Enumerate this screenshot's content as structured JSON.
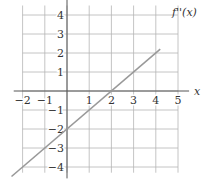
{
  "chart_data": {
    "type": "line",
    "title": "",
    "xlabel": "x",
    "ylabel": "",
    "series": [
      {
        "name": "f''(x)",
        "x": [
          -2.5,
          4.2
        ],
        "y": [
          -4.5,
          2.2
        ],
        "equation": "f''(x) = x - 2"
      }
    ],
    "xlim": [
      -2,
      5
    ],
    "ylim": [
      -4,
      4
    ],
    "x_ticks": [
      "−2",
      "−1",
      "1",
      "2",
      "3",
      "4",
      "5"
    ],
    "y_ticks": [
      "4",
      "3",
      "2",
      "1",
      "−1",
      "−2",
      "−3",
      "−4"
    ],
    "grid": true,
    "curve_label": "f''(x)",
    "colors": {
      "line": "#999999",
      "grid": "#aaaaaa",
      "axis": "#555555"
    }
  }
}
